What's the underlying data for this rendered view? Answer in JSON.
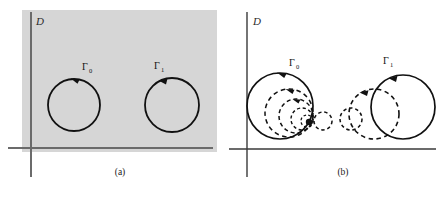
{
  "figure": {
    "panels": [
      {
        "id": "a",
        "caption": "(a)",
        "domain_label": "D",
        "background": "#d6d6d6",
        "axis_color": "#6b6b6b",
        "curve_color": "#111111",
        "curves": [
          {
            "name": "Gamma-0",
            "label": "Γ",
            "subscript": "0",
            "style": "solid",
            "cx": 74,
            "cy": 105,
            "r": 26,
            "orientation": "counterclockwise",
            "label_x": 82,
            "label_y": 70
          },
          {
            "name": "Gamma-1",
            "label": "Γ",
            "subscript": "1",
            "style": "solid",
            "cx": 172,
            "cy": 105,
            "r": 27,
            "orientation": "counterclockwise",
            "label_x": 157,
            "label_y": 69
          }
        ]
      },
      {
        "id": "b",
        "caption": "(b)",
        "domain_label": "D",
        "background": "#ffffff",
        "axis_color": "#3a3a3a",
        "curve_color": "#111111",
        "curves": [
          {
            "name": "Gamma-0",
            "label": "Γ",
            "subscript": "0",
            "style": "solid",
            "cx": 57,
            "cy": 106,
            "r": 33,
            "orientation": "counterclockwise",
            "label_x": 69,
            "label_y": 65
          },
          {
            "name": "Gamma-0-homotopy-1",
            "style": "dashed",
            "cx": 66,
            "cy": 113,
            "r": 24,
            "orientation": "counterclockwise"
          },
          {
            "name": "Gamma-0-homotopy-2",
            "style": "dashed",
            "cx": 73,
            "cy": 116,
            "r": 17,
            "orientation": "counterclockwise"
          },
          {
            "name": "Gamma-0-homotopy-3",
            "style": "dashed",
            "cx": 79,
            "cy": 119,
            "r": 11,
            "orientation": "counterclockwise"
          },
          {
            "name": "Gamma-0-homotopy-4",
            "style": "dashed",
            "cx": 84,
            "cy": 121,
            "r": 6,
            "orientation": "counterclockwise"
          },
          {
            "name": "Gamma-0-point",
            "style": "dashed",
            "cx": 100,
            "cy": 121,
            "r": 9,
            "orientation": "counterclockwise"
          },
          {
            "name": "Gamma-1",
            "label": "Γ",
            "subscript": "1",
            "style": "solid",
            "cx": 180,
            "cy": 107,
            "r": 32,
            "orientation": "counterclockwise",
            "label_x": 163,
            "label_y": 64
          },
          {
            "name": "Gamma-1-homotopy-1",
            "style": "dashed",
            "cx": 151,
            "cy": 114,
            "r": 25,
            "orientation": "counterclockwise"
          },
          {
            "name": "Gamma-1-homotopy-2",
            "style": "dashed",
            "cx": 128,
            "cy": 119,
            "r": 11,
            "orientation": "counterclockwise"
          }
        ]
      }
    ]
  }
}
